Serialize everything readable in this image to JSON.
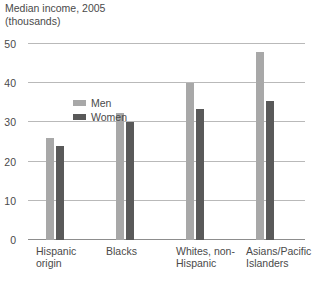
{
  "chart_data": {
    "type": "bar",
    "title": "Median income, 2005",
    "subtitle": "(thousands)",
    "xlabel": "",
    "ylabel": "",
    "ylim": [
      0,
      50
    ],
    "yticks": [
      0,
      10,
      20,
      30,
      40,
      50
    ],
    "ytick_labels": [
      "0",
      "10",
      "20",
      "30",
      "40",
      "50"
    ],
    "grid": true,
    "legend_position": "inside-top-left",
    "categories": [
      "Hispanic origin",
      "Blacks",
      "Whites, non-Hispanic",
      "Asians/Pacific Islanders"
    ],
    "category_lines": [
      [
        "Hispanic",
        "origin"
      ],
      [
        "Blacks",
        ""
      ],
      [
        "Whites, non-",
        "Hispanic"
      ],
      [
        "Asians/Pacific",
        "Islanders"
      ]
    ],
    "series": [
      {
        "name": "Men",
        "color": "#a8a8a8",
        "values": [
          26,
          32.5,
          40,
          48
        ]
      },
      {
        "name": "Women",
        "color": "#595959",
        "values": [
          24,
          30,
          33.5,
          35.5
        ]
      }
    ]
  },
  "colors": {
    "men": "#a8a8a8",
    "women": "#595959",
    "gridline": "#b9b9b9",
    "axis": "#8d8d8d",
    "text": "#4a4a4a",
    "background": "#ffffff"
  }
}
